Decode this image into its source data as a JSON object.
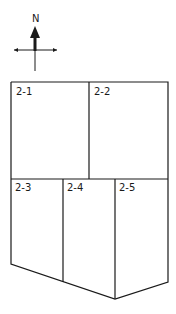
{
  "compass": {
    "label": "N"
  },
  "parcels": [
    {
      "id": "2-1",
      "label": "2-1"
    },
    {
      "id": "2-2",
      "label": "2-2"
    },
    {
      "id": "2-3",
      "label": "2-3"
    },
    {
      "id": "2-4",
      "label": "2-4"
    },
    {
      "id": "2-5",
      "label": "2-5"
    }
  ],
  "colors": {
    "line": "#1a1a1a",
    "background": "#ffffff"
  }
}
